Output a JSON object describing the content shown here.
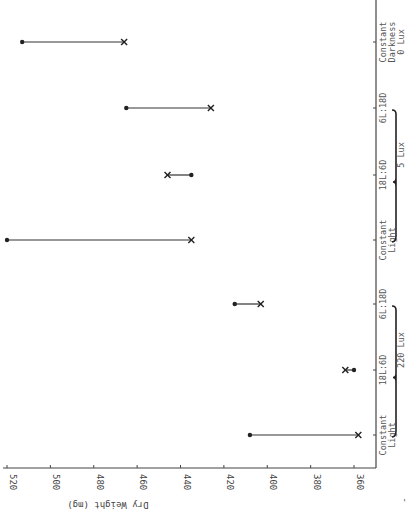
{
  "chart_data": {
    "type": "range-dot",
    "orientation": "rotated-90",
    "title": "",
    "ylabel": "Dry Weight (mg)",
    "xlabel": "",
    "ylim": [
      360,
      520
    ],
    "yticks": [
      520,
      500,
      480,
      460,
      440,
      420,
      400,
      380,
      360
    ],
    "grid": false,
    "legend": null,
    "groups": [
      {
        "label": "220 Lux",
        "categories": [
          "Constant Light",
          "18L:6D",
          "6L:18D"
        ]
      },
      {
        "label": "5 Lux",
        "categories": [
          "Constant Light",
          "18L:6D",
          "6L:18D"
        ]
      },
      {
        "label": "0 Lux",
        "categories": [
          "Constant Darkness"
        ]
      }
    ],
    "categories": [
      "Constant Light (220 Lux)",
      "18L:6D (220 Lux)",
      "6L:18D (220 Lux)",
      "Constant Light (5 Lux)",
      "18L:6D (5 Lux)",
      "6L:18D (5 Lux)",
      "Constant Darkness (0 Lux)"
    ],
    "series": [
      {
        "name": "dot",
        "marker": "circle",
        "values": [
          408,
          360,
          415,
          520,
          435,
          465,
          513
        ]
      },
      {
        "name": "x",
        "marker": "x",
        "values": [
          358,
          364,
          403,
          435,
          446,
          426,
          466
        ]
      }
    ]
  },
  "labels": {
    "ylabel": "Dry Weight (mg)",
    "yticks": [
      "520",
      "500",
      "480",
      "460",
      "440",
      "420",
      "400",
      "380",
      "360"
    ],
    "categories": [
      [
        "Constant",
        "Light"
      ],
      [
        "18L:6D"
      ],
      [
        "6L:18D"
      ],
      [
        "Constant",
        "Light"
      ],
      [
        "18L:6D"
      ],
      [
        "6L:18D"
      ],
      [
        "Constant",
        "Darkness",
        "0 Lux"
      ]
    ],
    "group_labels": [
      "220 Lux",
      "5 Lux"
    ],
    "corner_mark": "'"
  }
}
